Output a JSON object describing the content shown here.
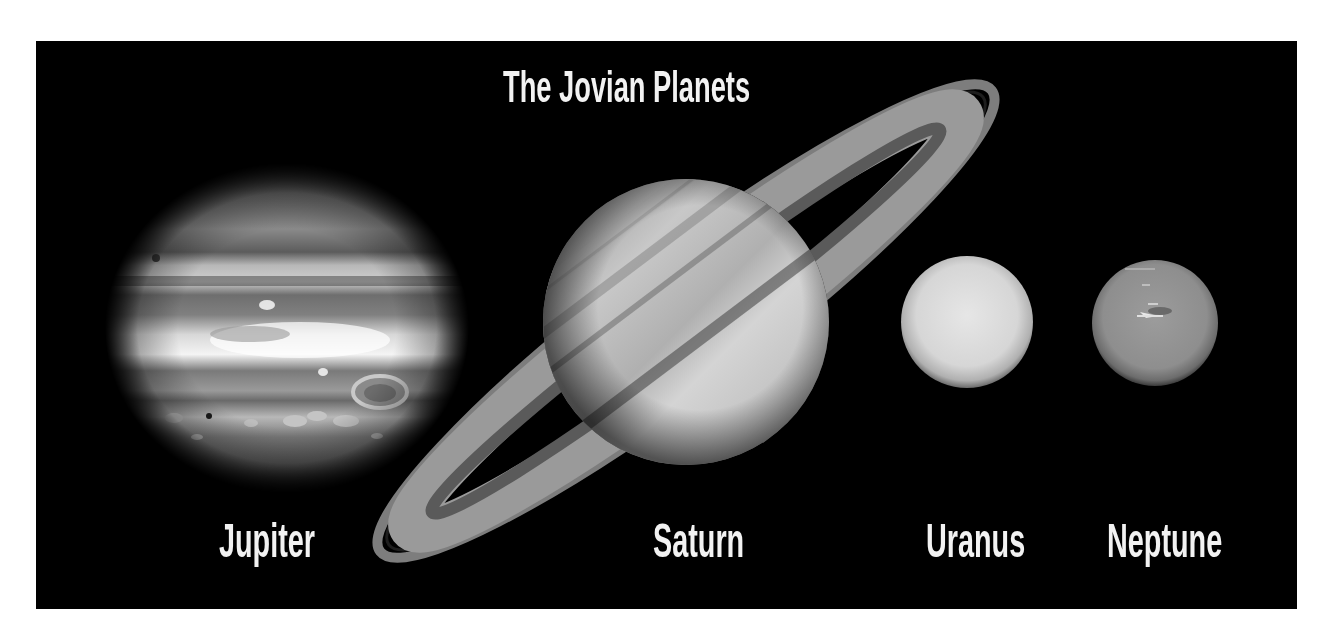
{
  "title": "The Jovian Planets",
  "colors": {
    "panel_background": "#000000",
    "page_background": "#ffffff",
    "label_text": "#f2f2f2"
  },
  "planets": [
    {
      "name": "Jupiter",
      "order": 1,
      "features": [
        "cloud bands",
        "Great Red Spot",
        "white ovals"
      ]
    },
    {
      "name": "Saturn",
      "order": 2,
      "features": [
        "ring system",
        "Cassini division",
        "cloud bands"
      ]
    },
    {
      "name": "Uranus",
      "order": 3,
      "features": [
        "featureless disk"
      ]
    },
    {
      "name": "Neptune",
      "order": 4,
      "features": [
        "Great Dark Spot",
        "bright clouds"
      ]
    }
  ]
}
